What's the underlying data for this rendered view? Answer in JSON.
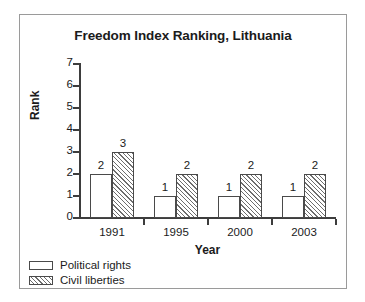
{
  "chart_data": {
    "type": "bar",
    "title": "Freedom Index Ranking, Lithuania",
    "xlabel": "Year",
    "ylabel": "Rank",
    "categories": [
      "1991",
      "1995",
      "2000",
      "2003"
    ],
    "series": [
      {
        "name": "Political rights",
        "values": [
          2,
          1,
          1,
          1
        ],
        "fill": "white"
      },
      {
        "name": "Civil liberties",
        "values": [
          3,
          2,
          2,
          2
        ],
        "fill": "diagonal-hatch"
      }
    ],
    "ylim": [
      0,
      7
    ],
    "yticks": [
      0,
      1,
      2,
      3,
      4,
      5,
      6,
      7
    ],
    "ytick_labels": [
      "0",
      "1",
      "2",
      "3",
      "4",
      "5",
      "6",
      "7"
    ],
    "grid": false,
    "legend_position": "below-left-outside",
    "data_labels": true,
    "colors": {
      "axis": "#3d3d3d",
      "bar_outline": "#4a4a4a",
      "hatch": "#6d6d6d",
      "text": "#1b1b1b",
      "frame": "#9a9a9a",
      "background": "#ffffff"
    }
  },
  "legend": {
    "items": [
      {
        "label": "Political rights",
        "swatch": "white"
      },
      {
        "label": "Civil liberties",
        "swatch": "diagonal-hatch"
      }
    ]
  }
}
